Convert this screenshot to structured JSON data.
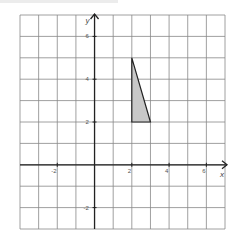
{
  "diagram": {
    "type": "coordinate-grid",
    "x_axis_label": "x",
    "y_axis_label": "y",
    "x_range": [
      -4,
      7
    ],
    "y_range": [
      -3,
      7
    ],
    "x_tick_labels": [
      {
        "value": -2,
        "text": "-2"
      },
      {
        "value": 2,
        "text": "2"
      },
      {
        "value": 4,
        "text": "4"
      },
      {
        "value": 6,
        "text": "6"
      }
    ],
    "y_tick_labels": [
      {
        "value": 6,
        "text": "6"
      },
      {
        "value": 4,
        "text": "4"
      },
      {
        "value": 2,
        "text": "2"
      },
      {
        "value": -2,
        "text": "-2"
      }
    ],
    "shape": {
      "name": "triangle",
      "vertices": [
        [
          2,
          5
        ],
        [
          2,
          2
        ],
        [
          3,
          2
        ]
      ],
      "fill": "#c8c8c8",
      "stroke": "#222222"
    },
    "colors": {
      "grid": "#888888",
      "axis": "#222222",
      "label": "#555555"
    }
  }
}
